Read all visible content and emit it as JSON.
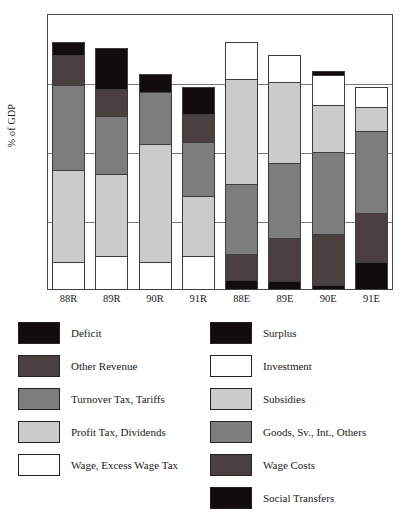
{
  "chart_data": {
    "type": "bar",
    "subtype": "stacked-bar",
    "title": "",
    "xlabel": "",
    "ylabel": "% of GDP",
    "ylim": [
      0,
      40
    ],
    "yticks": [
      0,
      10,
      20,
      30,
      40
    ],
    "grid": true,
    "legend_position": "below-two-columns",
    "categories": [
      "88R",
      "89R",
      "90R",
      "91R",
      "88E",
      "89E",
      "90E",
      "91E"
    ],
    "series": [
      {
        "name": "Wage, Excess Wage Tax",
        "color": "#ffffff",
        "values": [
          4.0,
          5.0,
          4.0,
          5.0,
          0,
          0,
          0,
          0
        ]
      },
      {
        "name": "Profit Tax, Dividends",
        "color": "#cbcbcb",
        "values": [
          13.5,
          12.0,
          17.3,
          8.7,
          0,
          0,
          0,
          0
        ]
      },
      {
        "name": "Turnover Tax, Tariffs",
        "color": "#7d7d7d",
        "values": [
          12.5,
          8.5,
          7.7,
          8.0,
          0,
          0,
          0,
          0
        ]
      },
      {
        "name": "Other Revenue",
        "color": "#4a4040",
        "values": [
          4.5,
          4.0,
          0,
          4.3,
          0,
          0,
          0,
          0
        ]
      },
      {
        "name": "Deficit",
        "color": "#120d0d",
        "values": [
          2.0,
          6.2,
          2.7,
          4.0,
          0,
          0,
          0,
          0
        ]
      },
      {
        "name": "Social Transfers",
        "color": "#120d0d",
        "values": [
          0,
          0,
          0,
          0,
          1.5,
          1.3,
          0.7,
          4.0
        ]
      },
      {
        "name": "Wage Costs",
        "color": "#4a4040",
        "values": [
          0,
          0,
          0,
          0,
          3.9,
          6.4,
          7.5,
          7.3
        ]
      },
      {
        "name": "Goods, Sv., Int., Others",
        "color": "#7d7d7d",
        "values": [
          0,
          0,
          0,
          0,
          10.3,
          11.0,
          12.1,
          12.0
        ]
      },
      {
        "name": "Subsidies",
        "color": "#cbcbcb",
        "values": [
          0,
          0,
          0,
          0,
          15.3,
          11.9,
          7.0,
          3.7
        ]
      },
      {
        "name": "Investment",
        "color": "#ffffff",
        "values": [
          0,
          0,
          0,
          0,
          5.5,
          4.0,
          4.4,
          3.0
        ]
      },
      {
        "name": "Surplus",
        "color": "#120d0d",
        "values": [
          0,
          0,
          0,
          0,
          0,
          0,
          0.7,
          0
        ]
      }
    ],
    "totals": [
      36.5,
      35.7,
      31.7,
      30.0,
      36.5,
      34.6,
      31.7,
      30.0
    ],
    "stack_order_revenue": [
      "Wage, Excess Wage Tax",
      "Profit Tax, Dividends",
      "Turnover Tax, Tariffs",
      "Other Revenue",
      "Deficit"
    ],
    "stack_order_expenditure": [
      "Social Transfers",
      "Wage Costs",
      "Goods, Sv., Int., Others",
      "Subsidies",
      "Investment",
      "Surplus"
    ]
  },
  "axis": {
    "y_title": "% of GDP",
    "y_tick_labels": [
      "40",
      "30",
      "20",
      "10",
      "0"
    ],
    "x_tick_labels": [
      "88R",
      "89R",
      "90R",
      "91R",
      "88E",
      "89E",
      "90E",
      "91E"
    ]
  },
  "legend": {
    "left_column": [
      {
        "label": "Deficit",
        "color": "#120d0d"
      },
      {
        "label": "Other Revenue",
        "color": "#4a4040"
      },
      {
        "label": "Turnover Tax, Tariffs",
        "color": "#7d7d7d"
      },
      {
        "label": "Profit Tax, Dividends",
        "color": "#cbcbcb"
      },
      {
        "label": "Wage, Excess Wage Tax",
        "color": "#ffffff"
      }
    ],
    "right_column": [
      {
        "label": "Surplus",
        "color": "#120d0d"
      },
      {
        "label": "Investment",
        "color": "#ffffff"
      },
      {
        "label": "Subsidies",
        "color": "#cbcbcb"
      },
      {
        "label": "Goods, Sv., Int., Others",
        "color": "#7d7d7d"
      },
      {
        "label": "Wage Costs",
        "color": "#4a4040"
      },
      {
        "label": "Social Transfers",
        "color": "#120d0d"
      }
    ]
  }
}
